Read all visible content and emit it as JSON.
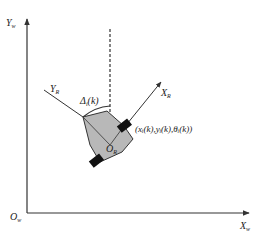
{
  "diagram": {
    "world_frame": {
      "y_axis_label": "Y",
      "y_axis_sub": "w",
      "x_axis_label": "X",
      "x_axis_sub": "w",
      "origin_label": "O",
      "origin_sub": "w"
    },
    "robot_frame": {
      "x_axis_label": "X",
      "x_axis_sub": "R",
      "y_axis_label": "Y",
      "y_axis_sub": "R",
      "origin_label": "O",
      "origin_sub": "R"
    },
    "angle_label": {
      "symbol": "Δ",
      "sub": "i",
      "arg": "(k)"
    },
    "pose_label": "(xᵢ(k),yᵢ(k),θᵢ(k))",
    "colors": {
      "lines": "#333333",
      "robot_body": "#b8b8b8",
      "wheels": "#111111"
    }
  }
}
